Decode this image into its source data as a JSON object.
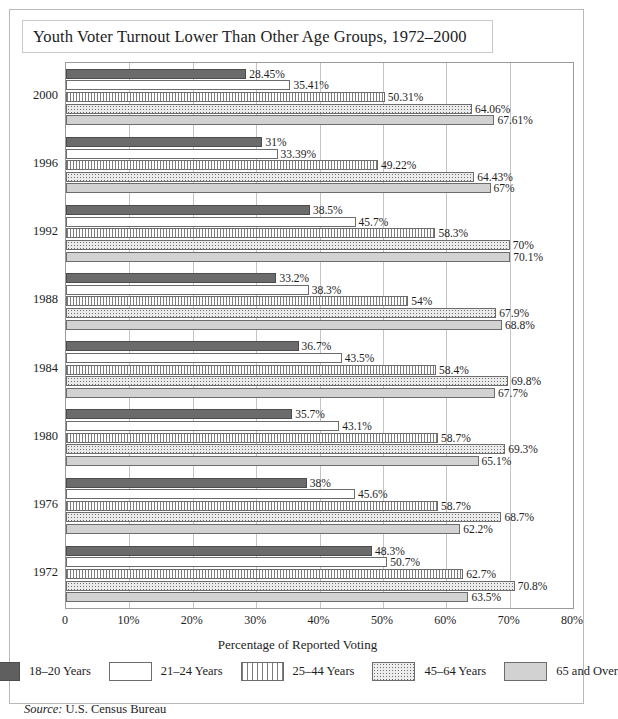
{
  "title": "Youth Voter Turnout Lower Than Other Age Groups, 1972–2000",
  "source_prefix": "Source:",
  "source_text": "U.S. Census Bureau",
  "chart_data": {
    "type": "bar",
    "orientation": "horizontal",
    "title": "Youth Voter Turnout Lower Than Other Age Groups, 1972–2000",
    "xlabel": "Percentage of Reported Voting",
    "ylabel": "",
    "xlim": [
      0,
      80
    ],
    "xticks": [
      0,
      10,
      20,
      30,
      40,
      50,
      60,
      70,
      80
    ],
    "xtick_labels": [
      "0",
      "10%",
      "20%",
      "30%",
      "40%",
      "50%",
      "60%",
      "70%",
      "80%"
    ],
    "grid": true,
    "legend_position": "bottom",
    "categories": [
      "2000",
      "1996",
      "1992",
      "1988",
      "1984",
      "1980",
      "1976",
      "1972"
    ],
    "series": [
      {
        "name": "18–20 Years",
        "pattern": "solid-dark-gray",
        "color": "#6b6b6b",
        "values": [
          28.45,
          31,
          38.5,
          33.2,
          36.7,
          35.7,
          38,
          48.3
        ],
        "labels": [
          "28.45%",
          "31%",
          "38.5%",
          "33.2%",
          "36.7%",
          "35.7%",
          "38%",
          "48.3%"
        ]
      },
      {
        "name": "21–24 Years",
        "pattern": "white",
        "color": "#ffffff",
        "values": [
          35.41,
          33.39,
          45.7,
          38.3,
          43.5,
          43.1,
          45.6,
          50.7
        ],
        "labels": [
          "35.41%",
          "33.39%",
          "45.7%",
          "38.3%",
          "43.5%",
          "43.1%",
          "45.6%",
          "50.7%"
        ]
      },
      {
        "name": "25–44 Years",
        "pattern": "vertical-stripes",
        "color": "#7d7d7d",
        "values": [
          50.31,
          49.22,
          58.3,
          54,
          58.4,
          58.7,
          58.7,
          62.7
        ],
        "labels": [
          "50.31%",
          "49.22%",
          "58.3%",
          "54%",
          "58.4%",
          "58.7%",
          "58.7%",
          "62.7%"
        ]
      },
      {
        "name": "45–64 Years",
        "pattern": "speckled",
        "color": "#ebebeb",
        "values": [
          64.06,
          64.43,
          70,
          67.9,
          69.8,
          69.3,
          68.7,
          70.8
        ],
        "labels": [
          "64.06%",
          "64.43%",
          "70%",
          "67.9%",
          "69.8%",
          "69.3%",
          "68.7%",
          "70.8%"
        ]
      },
      {
        "name": "65 and Over",
        "pattern": "solid-light-gray",
        "color": "#d2d2d2",
        "values": [
          67.61,
          67,
          70.1,
          68.8,
          67.7,
          65.1,
          62.2,
          63.5
        ],
        "labels": [
          "67.61%",
          "67%",
          "70.1%",
          "68.8%",
          "67.7%",
          "65.1%",
          "62.2%",
          "63.5%"
        ]
      }
    ]
  }
}
